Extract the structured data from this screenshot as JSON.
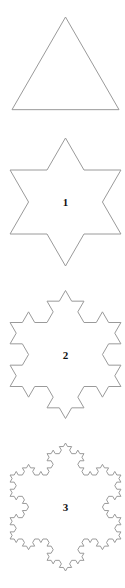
{
  "figure": {
    "stroke_color": "#9a9a9a",
    "label_color": "#111111",
    "shapes": [
      {
        "iteration": 0,
        "label": "",
        "cx": 65.5,
        "cy": 82,
        "radius": 63
      },
      {
        "iteration": 1,
        "label": "1",
        "cx": 65.5,
        "cy": 202,
        "radius": 64
      },
      {
        "iteration": 2,
        "label": "2",
        "cx": 65.5,
        "cy": 354.5,
        "radius": 64
      },
      {
        "iteration": 3,
        "label": "3",
        "cx": 65.5,
        "cy": 507,
        "radius": 64
      }
    ]
  }
}
